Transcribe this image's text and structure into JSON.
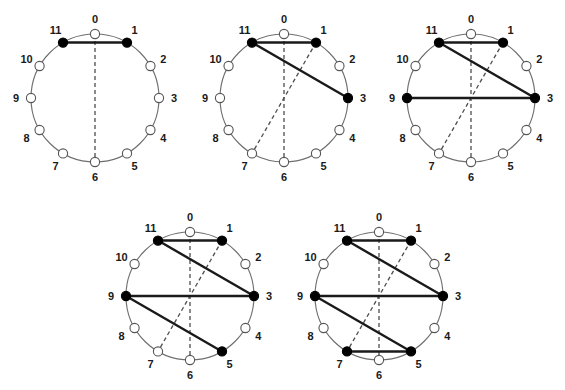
{
  "figure": {
    "canvas": {
      "width": 565,
      "height": 390
    },
    "background_color": "#ffffff",
    "node_count": 12,
    "node_labels": [
      "0",
      "1",
      "2",
      "3",
      "4",
      "5",
      "6",
      "7",
      "8",
      "9",
      "10",
      "11"
    ],
    "radius": 64,
    "node_radius": 4.6,
    "label_offset": 15,
    "colors": {
      "filled_node": "#000000",
      "hollow_node_fill": "#ffffff",
      "node_stroke": "#555555",
      "circle_stroke": "#6e6e6e",
      "solid_chord": "#1a1a1a",
      "dashed_chord": "#4d4d4d",
      "label_text": "#1a1a1a"
    },
    "stroke_widths": {
      "circle": 1.1,
      "solid_chord": 2.4,
      "dashed_chord": 1.3,
      "node": 1.1
    },
    "dash_pattern": "4,3",
    "panels": [
      {
        "id": "panel-1",
        "name": "diagram-1",
        "center": {
          "x": 95,
          "y": 98
        },
        "filled_nodes": [
          11,
          1
        ],
        "solid_chords": [
          [
            11,
            1
          ]
        ],
        "dashed_chords": [
          [
            0,
            6
          ]
        ]
      },
      {
        "id": "panel-2",
        "name": "diagram-2",
        "center": {
          "x": 284,
          "y": 98
        },
        "filled_nodes": [
          11,
          1,
          3
        ],
        "solid_chords": [
          [
            11,
            1
          ],
          [
            11,
            3
          ]
        ],
        "dashed_chords": [
          [
            0,
            6
          ],
          [
            1,
            7
          ]
        ]
      },
      {
        "id": "panel-3",
        "name": "diagram-3",
        "center": {
          "x": 471,
          "y": 98
        },
        "filled_nodes": [
          11,
          1,
          3,
          9
        ],
        "solid_chords": [
          [
            11,
            1
          ],
          [
            11,
            3
          ],
          [
            9,
            3
          ]
        ],
        "dashed_chords": [
          [
            0,
            6
          ],
          [
            1,
            7
          ]
        ]
      },
      {
        "id": "panel-4",
        "name": "diagram-4",
        "center": {
          "x": 190,
          "y": 296
        },
        "filled_nodes": [
          11,
          1,
          3,
          9,
          5
        ],
        "solid_chords": [
          [
            11,
            1
          ],
          [
            11,
            3
          ],
          [
            9,
            3
          ],
          [
            9,
            5
          ]
        ],
        "dashed_chords": [
          [
            0,
            6
          ],
          [
            1,
            7
          ]
        ]
      },
      {
        "id": "panel-5",
        "name": "diagram-5",
        "center": {
          "x": 379,
          "y": 296
        },
        "filled_nodes": [
          11,
          1,
          3,
          9,
          5,
          7
        ],
        "solid_chords": [
          [
            11,
            1
          ],
          [
            11,
            3
          ],
          [
            9,
            3
          ],
          [
            9,
            5
          ],
          [
            7,
            5
          ]
        ],
        "dashed_chords": [
          [
            0,
            6
          ],
          [
            1,
            7
          ]
        ]
      }
    ]
  }
}
